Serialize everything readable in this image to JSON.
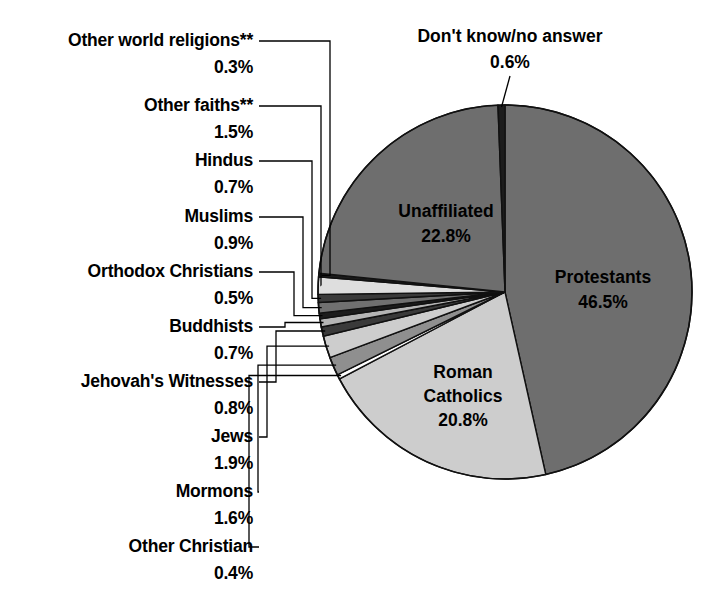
{
  "chart_data": {
    "type": "pie",
    "title": "",
    "subtitle": "",
    "legend_position": "callout-labels",
    "grid": false,
    "total_label": "",
    "units": "%",
    "categories": [
      "Protestants",
      "Roman Catholics",
      "Other Christian",
      "Mormons",
      "Jews",
      "Jehovah's Witnesses",
      "Buddhists",
      "Orthodox Christians",
      "Muslims",
      "Hindus",
      "Other faiths**",
      "Other world religions**",
      "Unaffiliated",
      "Don't know/no answer"
    ],
    "values": [
      46.5,
      20.8,
      0.4,
      1.6,
      1.9,
      0.8,
      0.7,
      0.5,
      0.9,
      0.7,
      1.5,
      0.3,
      22.8,
      0.6
    ],
    "colors": [
      "#6e6e6e",
      "#cdcdcd",
      "#ffffff",
      "#8f8f8f",
      "#cdcdcd",
      "#3a3a3a",
      "#b5b5b5",
      "#1c1c1c",
      "#707070",
      "#3a3a3a",
      "#dedede",
      "#1c1c1c",
      "#6e6e6e",
      "#1c1c1c"
    ]
  },
  "pie": {
    "center_x": 505,
    "center_y": 292,
    "radius": 187,
    "start_angle_deg": -90,
    "inner_labels": [
      {
        "name": "Protestants",
        "pct": "46.5%",
        "x": 603,
        "y": 283
      },
      {
        "name": "Roman Catholics",
        "pct": "20.8%",
        "x": 463,
        "y": 378,
        "two_line": true,
        "line1": "Roman",
        "line2": "Catholics"
      },
      {
        "name": "Unaffiliated",
        "pct": "22.8%",
        "x": 446,
        "y": 217
      }
    ]
  },
  "top_label": {
    "name": "Don't know/no answer",
    "pct": "0.6%",
    "name_x": 510,
    "name_y": 42,
    "pct_x": 510,
    "pct_y": 68
  },
  "callouts": [
    {
      "id": "other-world-religions",
      "name": "Other world religions**",
      "pct": "0.3%",
      "name_y": 46,
      "pct_y": 73
    },
    {
      "id": "other-faiths",
      "name": "Other faiths**",
      "pct": "1.5%",
      "name_y": 111,
      "pct_y": 138
    },
    {
      "id": "hindus",
      "name": "Hindus",
      "pct": "0.7%",
      "name_y": 166,
      "pct_y": 193
    },
    {
      "id": "muslims",
      "name": "Muslims",
      "pct": "0.9%",
      "name_y": 222,
      "pct_y": 249
    },
    {
      "id": "orthodox-christians",
      "name": "Orthodox Christians",
      "pct": "0.5%",
      "name_y": 277,
      "pct_y": 304
    },
    {
      "id": "buddhists",
      "name": "Buddhists",
      "pct": "0.7%",
      "name_y": 332,
      "pct_y": 359
    },
    {
      "id": "jehovahs-witnesses",
      "name": "Jehovah's Witnesses",
      "pct": "0.8%",
      "name_y": 387,
      "pct_y": 414
    },
    {
      "id": "jews",
      "name": "Jews",
      "pct": "1.9%",
      "name_y": 442,
      "pct_y": 469
    },
    {
      "id": "mormons",
      "name": "Mormons",
      "pct": "1.6%",
      "name_y": 497,
      "pct_y": 524
    },
    {
      "id": "other-christian",
      "name": "Other Christian",
      "pct": "0.4%",
      "name_y": 552,
      "pct_y": 579
    }
  ]
}
